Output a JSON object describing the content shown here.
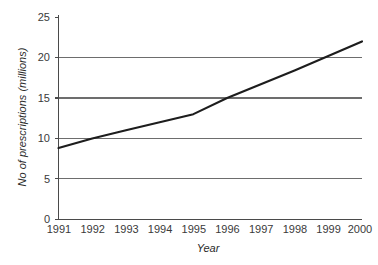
{
  "chart_data": {
    "type": "line",
    "title": "",
    "xlabel": "Year",
    "ylabel": "No of prescriptions (millions)",
    "x": [
      1991,
      1992,
      1993,
      1994,
      1995,
      1996,
      1997,
      1998,
      1999,
      2000
    ],
    "categories": [
      "1991",
      "1992",
      "1993",
      "1994",
      "1995",
      "1996",
      "1997",
      "1998",
      "1999",
      "2000"
    ],
    "values": [
      8.8,
      10.0,
      11.0,
      12.0,
      13.0,
      15.0,
      16.7,
      18.4,
      20.2,
      22.0
    ],
    "series": [
      {
        "name": "No of prescriptions (millions)",
        "values": [
          8.8,
          10.0,
          11.0,
          12.0,
          13.0,
          15.0,
          16.7,
          18.4,
          20.2,
          22.0
        ]
      }
    ],
    "xlim": [
      1991,
      2000
    ],
    "ylim": [
      0,
      25
    ],
    "yticks": [
      0,
      5,
      10,
      15,
      20,
      25
    ],
    "ytick_labels": [
      "0",
      "5",
      "10",
      "15",
      "20",
      "25"
    ],
    "xticks": [
      1991,
      1992,
      1993,
      1994,
      1995,
      1996,
      1997,
      1998,
      1999,
      2000
    ],
    "xtick_labels": [
      "1991",
      "1992",
      "1993",
      "1994",
      "1995",
      "1996",
      "1997",
      "1998",
      "1999",
      "2000"
    ],
    "grid": "horizontal",
    "legend": "none",
    "line_color": "#1d1d1d",
    "grid_color": "#6d6d6d",
    "axis_color": "#4a4a4a",
    "background_color": "#ffffff"
  },
  "labels": {
    "y_axis_title": "No of prescriptions (millions)",
    "x_axis_title": "Year",
    "y_0": "0",
    "y_5": "5",
    "y_10": "10",
    "y_15": "15",
    "y_20": "20",
    "y_25": "25",
    "x_1991": "1991",
    "x_1992": "1992",
    "x_1993": "1993",
    "x_1994": "1994",
    "x_1995": "1995",
    "x_1996": "1996",
    "x_1997": "1997",
    "x_1998": "1998",
    "x_1999": "1999",
    "x_2000": "2000"
  }
}
